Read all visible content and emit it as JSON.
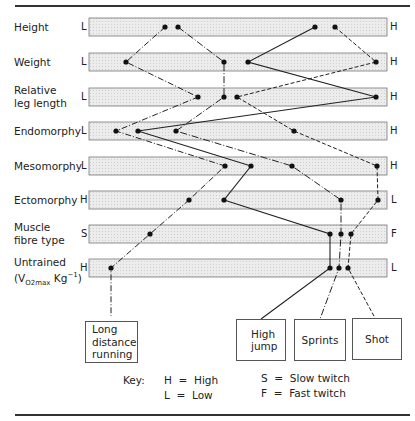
{
  "rows": [
    {
      "label": "Height",
      "low": "L",
      "high": "H",
      "y": 27
    },
    {
      "label": "Weight",
      "low": "L",
      "high": "H",
      "y": 62
    },
    {
      "label": "Relative leg length",
      "low": "L",
      "high": "H",
      "y": 97
    },
    {
      "label": "Endomorphy",
      "low": "L",
      "high": "H",
      "y": 131
    },
    {
      "label": "Mesomorphy",
      "low": "L",
      "high": "H",
      "y": 166
    },
    {
      "label": "Ectomorphy",
      "low": "H",
      "high": "L",
      "y": 200
    },
    {
      "label": "Muscle fibre type",
      "low": "S",
      "high": "F",
      "y": 234
    },
    {
      "label": "Untrained (VO2max Kg-1)",
      "low": "H",
      "high": "L",
      "y": 268
    }
  ],
  "labels": {
    "height": "Height",
    "weight": "Weight",
    "rel1": "Relative",
    "rel2": "leg length",
    "endo": "Endomorphy",
    "meso": "Mesomorphy",
    "ecto": "Ectomorphy",
    "mf1": "Muscle",
    "mf2": "fibre type",
    "un1": "Untrained",
    "un_open": "(V",
    "un_sub": "O",
    "un_sub2": "2max",
    "un_rest": " Kg",
    "un_sup": "−1",
    "un_close": ")"
  },
  "ends": {
    "left": [
      "L",
      "L",
      "L",
      "L",
      "L",
      "H",
      "S",
      "H"
    ],
    "right": [
      "H",
      "H",
      "H",
      "H",
      "H",
      "L",
      "F",
      "L"
    ]
  },
  "sports": {
    "long1": "Long",
    "long2": "distance",
    "long3": "running",
    "hj1": "High",
    "hj2": "jump",
    "sprints": "Sprints",
    "shot": "Shot"
  },
  "key": {
    "title": "Key:",
    "h": "H  =  High",
    "l": "L  =  Low",
    "s": "S  =  Slow twitch",
    "f": "F  =  Fast twitch"
  },
  "profiles": [
    {
      "name": "Long distance running",
      "style": "dash-dot",
      "x": [
        165,
        126,
        198,
        116,
        225,
        189,
        150,
        111
      ]
    },
    {
      "name": "High jump",
      "style": "solid",
      "x": [
        315,
        248,
        376,
        138,
        251,
        224,
        330,
        330
      ]
    },
    {
      "name": "Sprints",
      "style": "dash-dot",
      "x": [
        178,
        224,
        224,
        176,
        292,
        341,
        341,
        339
      ]
    },
    {
      "name": "Shot",
      "style": "dashed",
      "x": [
        335,
        376,
        237,
        294,
        377,
        378,
        351,
        348
      ]
    }
  ],
  "colors": {
    "bar_fill": "#e6e6e6",
    "bar_border": "#6a6a6a",
    "line": "#222222"
  }
}
